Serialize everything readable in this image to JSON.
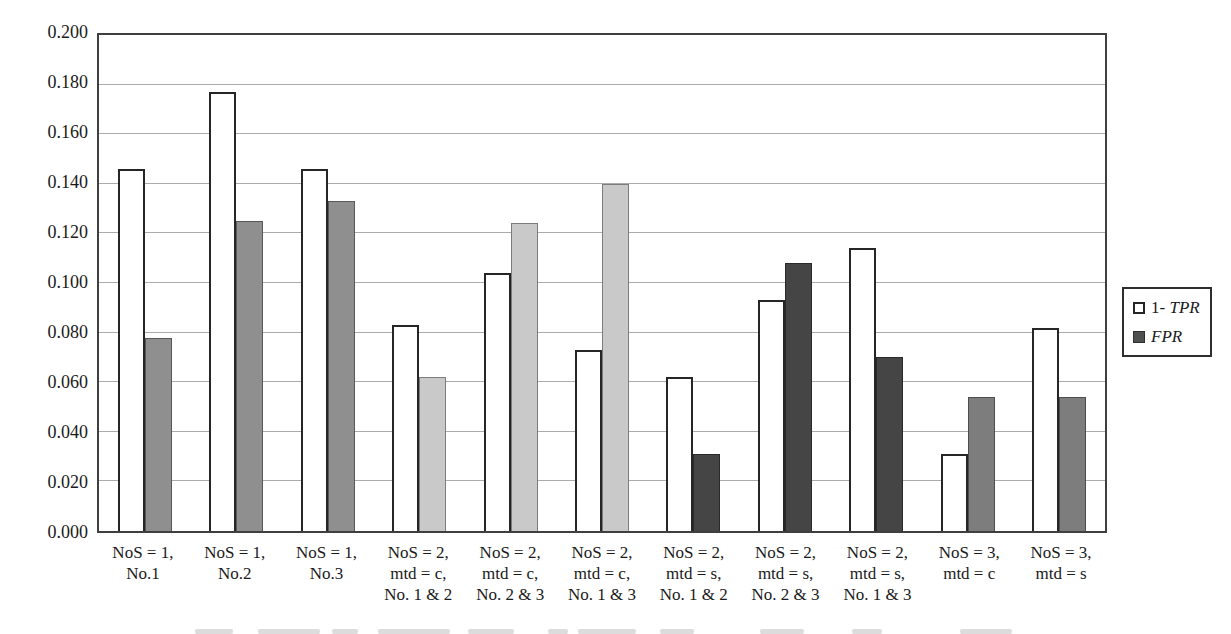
{
  "chart_data": {
    "type": "bar",
    "title": "",
    "xlabel": "",
    "ylabel": "",
    "ylim": [
      0,
      0.2
    ],
    "ytick_step": 0.02,
    "ytick_labels": [
      "0.000",
      "0.020",
      "0.040",
      "0.060",
      "0.080",
      "0.100",
      "0.120",
      "0.140",
      "0.160",
      "0.180",
      "0.200"
    ],
    "grid": true,
    "legend_position": "right",
    "categories": [
      {
        "lines": [
          "NoS = 1,",
          "No.1"
        ]
      },
      {
        "lines": [
          "NoS = 1,",
          "No.2"
        ]
      },
      {
        "lines": [
          "NoS = 1,",
          "No.3"
        ]
      },
      {
        "lines": [
          "NoS = 2,",
          "mtd = c,",
          "No. 1 & 2"
        ]
      },
      {
        "lines": [
          "NoS = 2,",
          "mtd = c,",
          "No. 2 & 3"
        ]
      },
      {
        "lines": [
          "NoS = 2,",
          "mtd = c,",
          "No. 1 & 3"
        ]
      },
      {
        "lines": [
          "NoS = 2,",
          "mtd = s,",
          "No. 1 & 2"
        ]
      },
      {
        "lines": [
          "NoS = 2,",
          "mtd = s,",
          "No. 2 & 3"
        ]
      },
      {
        "lines": [
          "NoS = 2,",
          "mtd = s,",
          "No. 1 & 3"
        ]
      },
      {
        "lines": [
          "NoS = 3,",
          "mtd = c"
        ]
      },
      {
        "lines": [
          "NoS = 3,",
          "mtd = s"
        ]
      }
    ],
    "series": [
      {
        "name": "1- TPR",
        "values": [
          0.146,
          0.177,
          0.146,
          0.083,
          0.104,
          0.073,
          0.062,
          0.093,
          0.114,
          0.031,
          0.082
        ],
        "fill": "#ffffff"
      },
      {
        "name": "FPR",
        "values": [
          0.078,
          0.125,
          0.133,
          0.062,
          0.124,
          0.14,
          0.031,
          0.108,
          0.07,
          0.054,
          0.054
        ],
        "fills": [
          "#8f8f8f",
          "#8f8f8f",
          "#8f8f8f",
          "#c9c9c9",
          "#c9c9c9",
          "#c9c9c9",
          "#454545",
          "#454545",
          "#454545",
          "#7d7d7d",
          "#7d7d7d"
        ]
      }
    ]
  },
  "legend": {
    "items": [
      {
        "prefix": "1- ",
        "italic": "TPR",
        "swatch": "tpr"
      },
      {
        "prefix": "",
        "italic": "FPR",
        "swatch": "fpr"
      }
    ]
  },
  "colors": {
    "axis_border": "#3f3f3f",
    "gridline": "#ababab",
    "bar_border": "#262626"
  }
}
